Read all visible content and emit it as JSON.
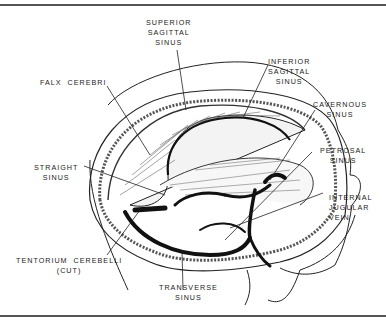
{
  "figure": {
    "labels": [
      {
        "id": "superior-sagittal-sinus",
        "lines": [
          "SUPERIOR",
          "SAGITTAL",
          "SINUS"
        ]
      },
      {
        "id": "falx-cerebri",
        "lines": [
          "FALX  CEREBRI"
        ]
      },
      {
        "id": "inferior-sagittal-sinus",
        "lines": [
          "INFERIOR",
          "SAGITTAL",
          "SINUS"
        ]
      },
      {
        "id": "cavernous-sinus",
        "lines": [
          "CAVERNOUS",
          "SINUS"
        ]
      },
      {
        "id": "straight-sinus",
        "lines": [
          "STRAIGHT",
          "SINUS"
        ]
      },
      {
        "id": "petrosal-sinus",
        "lines": [
          "PETROSAL",
          "SINUS"
        ]
      },
      {
        "id": "internal-jugular-vein",
        "lines": [
          "INTERNAL",
          "JUGULAR",
          "VEIN"
        ]
      },
      {
        "id": "tentorium-cerebelli",
        "lines": [
          "TENTORIUM  CEREBELLI",
          "(CUT)"
        ]
      },
      {
        "id": "transverse-sinus",
        "lines": [
          "TRANSVERSE",
          "SINUS"
        ]
      }
    ]
  },
  "text": {
    "superior": "SUPERIOR\nSAGITTAL\nSINUS",
    "falx": "FALX  CEREBRI",
    "inferior": "INFERIOR\nSAGITTAL\nSINUS",
    "cavernous": "CAVERNOUS\nSINUS",
    "straight": "STRAIGHT\nSINUS",
    "petrosal": "PETROSAL\nSINUS",
    "jugular": "INTERNAL\nJUGULAR\nVEIN",
    "tentorium": "TENTORIUM  CEREBELLI\n(CUT)",
    "transverse": "TRANSVERSE\nSINUS"
  }
}
